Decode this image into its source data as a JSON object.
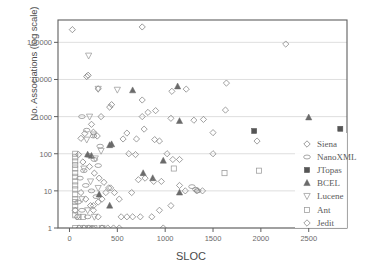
{
  "chart_data": {
    "type": "scatter",
    "title": "",
    "xlabel": "SLOC",
    "ylabel": "No. Associations (log scale)",
    "xlim": [
      -120,
      2900
    ],
    "ylim": [
      1,
      400000
    ],
    "yscale": "log",
    "grid": true,
    "grid_axis": "y",
    "legend_position": "right-inside",
    "xticks": [
      0,
      500,
      1000,
      1500,
      2000,
      2500
    ],
    "xtick_labels": [
      "0",
      "500",
      "1000",
      "1500",
      "2000",
      "2500"
    ],
    "yticks": [
      1,
      10,
      100,
      1000,
      10000,
      100000
    ],
    "ytick_labels": [
      "1",
      "10",
      "100",
      "1000",
      "10000",
      "100000"
    ],
    "series": [
      {
        "name": "Siena",
        "marker": "diamond-open",
        "color": "#7a7a7a",
        "points": [
          [
            30,
            220000
          ],
          [
            180,
            12000
          ],
          [
            195,
            13000
          ],
          [
            300,
            5600
          ],
          [
            760,
            260000
          ],
          [
            420,
            1800
          ],
          [
            440,
            2100
          ],
          [
            330,
            1000
          ],
          [
            230,
            620
          ],
          [
            160,
            350
          ],
          [
            250,
            380
          ],
          [
            290,
            300
          ],
          [
            120,
            260
          ],
          [
            95,
            95
          ],
          [
            140,
            60
          ],
          [
            210,
            45
          ],
          [
            260,
            30
          ],
          [
            310,
            22
          ],
          [
            360,
            17
          ],
          [
            410,
            12
          ],
          [
            120,
            9
          ],
          [
            170,
            6
          ],
          [
            220,
            4
          ],
          [
            60,
            3
          ],
          [
            80,
            2
          ],
          [
            100,
            1
          ],
          [
            150,
            1
          ],
          [
            200,
            1
          ]
        ]
      },
      {
        "name": "NanoXML",
        "marker": "ellipse-open",
        "color": "#8a8a8a",
        "points": [
          [
            130,
            1000
          ],
          [
            180,
            430
          ],
          [
            250,
            300
          ],
          [
            320,
            160
          ],
          [
            200,
            90
          ],
          [
            260,
            70
          ],
          [
            300,
            48
          ],
          [
            150,
            35
          ],
          [
            110,
            22
          ],
          [
            170,
            14
          ],
          [
            230,
            10
          ],
          [
            280,
            7
          ],
          [
            90,
            5
          ],
          [
            130,
            3
          ],
          [
            190,
            2
          ],
          [
            240,
            1
          ],
          [
            1320,
            11
          ],
          [
            1340,
            10
          ],
          [
            1280,
            13
          ]
        ]
      },
      {
        "name": "JTopas",
        "marker": "square-filled",
        "color": "#555555",
        "points": [
          [
            1930,
            410
          ],
          [
            2830,
            470
          ]
        ]
      },
      {
        "name": "BCEL",
        "marker": "triangle-up-filled",
        "color": "#6a6a6a",
        "points": [
          [
            660,
            5100
          ],
          [
            1130,
            6500
          ],
          [
            2500,
            950
          ],
          [
            1150,
            760
          ],
          [
            420,
            170
          ],
          [
            440,
            180
          ],
          [
            980,
            65
          ],
          [
            770,
            30
          ],
          [
            190,
            95
          ],
          [
            230,
            88
          ],
          [
            870,
            22
          ],
          [
            1150,
            9
          ],
          [
            310,
            8
          ],
          [
            420,
            4
          ]
        ]
      },
      {
        "name": "Lucene",
        "marker": "triangle-down-open",
        "color": "#9a9a9a",
        "points": [
          [
            200,
            44000
          ],
          [
            500,
            5300
          ],
          [
            300,
            5600
          ],
          [
            210,
            1000
          ],
          [
            250,
            330
          ],
          [
            180,
            240
          ],
          [
            330,
            120
          ],
          [
            270,
            75
          ],
          [
            150,
            40
          ],
          [
            220,
            18
          ],
          [
            300,
            12
          ],
          [
            130,
            6
          ],
          [
            190,
            3
          ],
          [
            260,
            2
          ],
          [
            340,
            1
          ]
        ]
      },
      {
        "name": "Ant",
        "marker": "square-open",
        "color": "#9a9a9a",
        "points": [
          [
            60,
            100
          ],
          [
            60,
            80
          ],
          [
            60,
            62
          ],
          [
            60,
            50
          ],
          [
            60,
            40
          ],
          [
            60,
            30
          ],
          [
            60,
            24
          ],
          [
            60,
            18
          ],
          [
            60,
            14
          ],
          [
            60,
            11
          ],
          [
            60,
            8
          ],
          [
            60,
            6
          ],
          [
            60,
            5
          ],
          [
            60,
            4
          ],
          [
            60,
            3
          ],
          [
            60,
            2.2
          ],
          [
            60,
            1
          ],
          [
            110,
            1
          ],
          [
            160,
            1
          ],
          [
            210,
            1
          ],
          [
            260,
            1
          ],
          [
            95,
            2
          ],
          [
            140,
            2
          ],
          [
            1980,
            35
          ],
          [
            1620,
            30
          ],
          [
            1090,
            40
          ]
        ]
      },
      {
        "name": "Jedit",
        "marker": "diamond-open",
        "color": "#808080",
        "points": [
          [
            2260,
            90000
          ],
          [
            1640,
            8000
          ],
          [
            1070,
            4800
          ],
          [
            1220,
            5500
          ],
          [
            760,
            2800
          ],
          [
            820,
            1300
          ],
          [
            900,
            1450
          ],
          [
            1060,
            900
          ],
          [
            1300,
            800
          ],
          [
            1400,
            840
          ],
          [
            1630,
            1500
          ],
          [
            1500,
            370
          ],
          [
            1960,
            220
          ],
          [
            1500,
            100
          ],
          [
            1080,
            70
          ],
          [
            1150,
            70
          ],
          [
            890,
            240
          ],
          [
            940,
            220
          ],
          [
            780,
            460
          ],
          [
            700,
            250
          ],
          [
            600,
            360
          ],
          [
            560,
            250
          ],
          [
            980,
            1
          ],
          [
            860,
            2
          ],
          [
            940,
            3
          ],
          [
            1060,
            4
          ],
          [
            1210,
            10
          ],
          [
            1330,
            10
          ],
          [
            650,
            9
          ],
          [
            720,
            20
          ],
          [
            790,
            22
          ],
          [
            880,
            18
          ],
          [
            960,
            18
          ],
          [
            1150,
            14
          ],
          [
            1390,
            10
          ],
          [
            520,
            6
          ],
          [
            470,
            9
          ],
          [
            430,
            12
          ],
          [
            380,
            9
          ],
          [
            340,
            6
          ],
          [
            300,
            5
          ],
          [
            250,
            4
          ],
          [
            540,
            2
          ],
          [
            600,
            2
          ],
          [
            660,
            2
          ],
          [
            740,
            2
          ],
          [
            460,
            1
          ],
          [
            520,
            1
          ],
          [
            340,
            1
          ],
          [
            400,
            1
          ],
          [
            300,
            2
          ],
          [
            250,
            3
          ],
          [
            760,
            1000
          ],
          [
            690,
            95
          ],
          [
            620,
            100
          ],
          [
            1020,
            100
          ]
        ]
      }
    ]
  }
}
